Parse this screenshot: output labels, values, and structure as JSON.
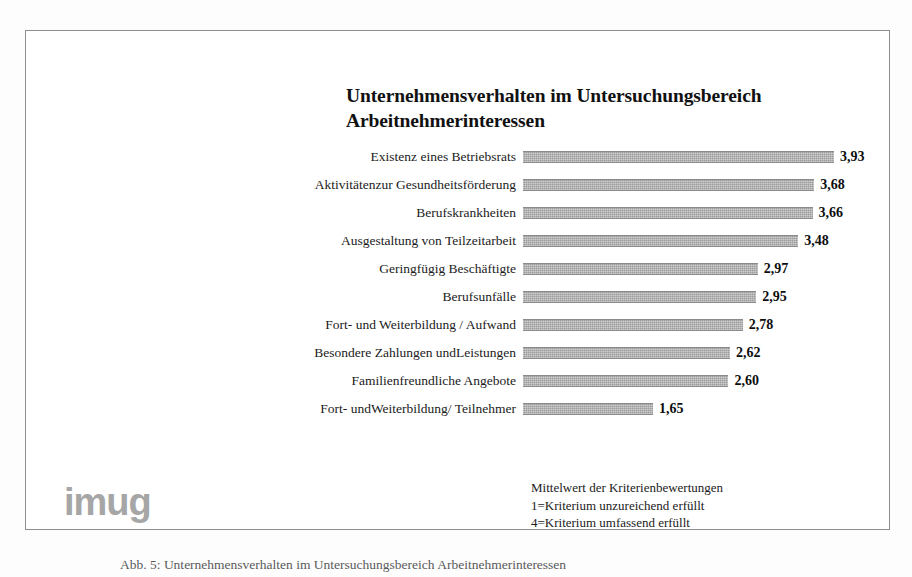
{
  "figure": {
    "title_lines": [
      "Unternehmensverhalten im Untersuchungsbereich",
      "Arbeitnehmerinteressen"
    ],
    "logo": "imug",
    "bottom_caption": "Abb. 5: Unternehmensverhalten im Untersuchungsbereich Arbeitnehmerinteressen"
  },
  "legend": {
    "lines": [
      "Mittelwert der Kriterienbewertungen",
      "1=Kriterium unzureichend erfüllt",
      "4=Kriterium umfassend erfüllt"
    ]
  },
  "colors": {
    "bar_fill": "#9b9b9b",
    "bar_edge": "#8a8a8a",
    "frame_border": "#8d8d8d",
    "title_text": "#111111",
    "label_text": "#1b1b1b",
    "value_text": "#0d0d0d",
    "logo_grey": "#a6a6a6",
    "background": "#ffffff"
  },
  "chart_data": {
    "type": "bar",
    "orientation": "horizontal",
    "title": "Unternehmensverhalten im Untersuchungsbereich Arbeitnehmerinteressen",
    "xlabel": "",
    "ylabel": "",
    "xlim": [
      0,
      4
    ],
    "grid": false,
    "legend_position": "below-right",
    "value_decimal_separator": ",",
    "categories": [
      "Existenz eines Betriebsrats",
      "Aktivitätenzur Gesundheitsförderung",
      "Berufskrankheiten",
      "Ausgestaltung von Teilzeitarbeit",
      "Geringfügig Beschäftigte",
      "Berufsunfälle",
      "Fort- und Weiterbildung / Aufwand",
      "Besondere Zahlungen undLeistungen",
      "Familienfreundliche Angebote",
      "Fort- undWeiterbildung/ Teilnehmer"
    ],
    "values": [
      3.93,
      3.68,
      3.66,
      3.48,
      2.97,
      2.95,
      2.78,
      2.62,
      2.6,
      1.65
    ],
    "value_labels": [
      "3,93",
      "3,68",
      "3,66",
      "3,48",
      "2,97",
      "2,95",
      "2,78",
      "2,62",
      "2,60",
      "1,65"
    ],
    "annotations": [
      "Mittelwert der Kriterienbewertungen",
      "1=Kriterium unzureichend erfüllt",
      "4=Kriterium umfassend erfüllt"
    ]
  }
}
